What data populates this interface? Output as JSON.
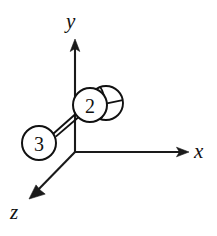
{
  "figure": {
    "background_color": "#ffffff",
    "line_color": "#111111",
    "width": 217,
    "height": 236
  },
  "axes": {
    "origin": {
      "x": 75,
      "y": 152
    },
    "items": [
      {
        "name": "y-axis",
        "label": "y",
        "label_x": 66,
        "label_y": 28,
        "tip_x": 75,
        "tip_y": 40,
        "direction": "up"
      },
      {
        "name": "x-axis",
        "label": "x",
        "label_x": 194,
        "label_y": 158,
        "tip_x": 188,
        "tip_y": 152,
        "direction": "right"
      },
      {
        "name": "z-axis",
        "label": "z",
        "label_x": 10,
        "label_y": 219,
        "tip_x": 30,
        "tip_y": 198,
        "direction": "down-left"
      }
    ]
  },
  "atoms": [
    {
      "name": "atom-2",
      "label": "2",
      "cx": 90,
      "cy": 105,
      "r": 17,
      "label_x": 90,
      "label_y": 106
    },
    {
      "name": "atom-3",
      "label": "3",
      "cx": 39,
      "cy": 143,
      "r": 17,
      "label_x": 39,
      "label_y": 144
    }
  ],
  "back_sphere": {
    "name": "back-sphere",
    "cx": 106,
    "cy": 103,
    "r": 17
  },
  "bond": {
    "name": "bond-2-3",
    "x1": 52,
    "y1": 132,
    "x2": 78,
    "y2": 112,
    "offset": 4
  }
}
